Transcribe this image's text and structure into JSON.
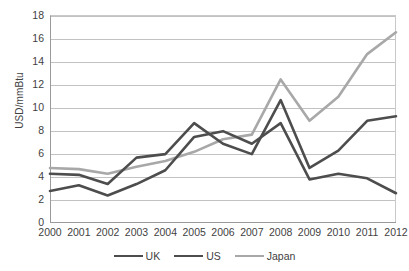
{
  "chart_data": {
    "type": "line",
    "title": "",
    "subtitle": "",
    "xlabel": "",
    "ylabel": "USD/mmBtu",
    "categories": [
      "2000",
      "2001",
      "2002",
      "2003",
      "2004",
      "2005",
      "2006",
      "2007",
      "2008",
      "2009",
      "2010",
      "2011",
      "2012"
    ],
    "x": [
      2000,
      2001,
      2002,
      2003,
      2004,
      2005,
      2006,
      2007,
      2008,
      2009,
      2010,
      2011,
      2012
    ],
    "ylim": [
      0,
      18
    ],
    "xlim": [
      2000,
      2012
    ],
    "y_ticks": [
      0,
      2,
      4,
      6,
      8,
      10,
      12,
      14,
      16,
      18
    ],
    "grid": "horizontal",
    "legend_position": "bottom-center",
    "series": [
      {
        "name": "UK",
        "color": "#4d4d4d",
        "width": 2.6,
        "values": [
          2.7,
          3.2,
          2.3,
          3.3,
          4.5,
          7.4,
          7.9,
          6.8,
          8.6,
          3.7,
          4.2,
          3.8,
          2.5
        ]
      },
      {
        "name": "US",
        "color": "#4d4d4d",
        "width": 2.6,
        "values": [
          4.2,
          4.1,
          3.3,
          5.6,
          5.9,
          8.6,
          6.8,
          5.9,
          10.6,
          4.7,
          6.2,
          8.8,
          9.2
        ]
      },
      {
        "name": "Japan",
        "color": "#a8a8a8",
        "width": 2.6,
        "values": [
          4.7,
          4.6,
          4.2,
          4.8,
          5.3,
          6.1,
          7.2,
          7.6,
          12.4,
          8.8,
          10.9,
          14.6,
          16.5
        ]
      }
    ]
  },
  "legend": {
    "items": [
      {
        "label": "UK"
      },
      {
        "label": "US"
      },
      {
        "label": "Japan"
      }
    ]
  }
}
